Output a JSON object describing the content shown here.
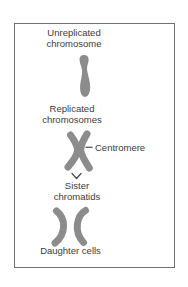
{
  "diagram": {
    "labels": {
      "unreplicated_chromosome": "Unreplicated chromosome",
      "replicated_chromosomes": "Replicated chromosomes",
      "centromere": "Centromere",
      "sister_chromatids": "Sister chromatids",
      "daughter_cells": "Daughter cells"
    },
    "colors": {
      "chromosome_fill": "#8c8c8c",
      "label_text": "#3c3c3c",
      "border": "#6f6f6f",
      "background": "#ffffff",
      "pointer_line": "#4a4a4a"
    },
    "icons": {
      "unreplicated_chromosome_shape": "single-chromatid-pin",
      "replicated_chromosome_shape": "x-shaped-chromosome",
      "daughter_chromosome_shape": "curved-chromatid",
      "sister_bracket": "chevron-down-connector",
      "centromere_pointer": "dash-line"
    }
  }
}
